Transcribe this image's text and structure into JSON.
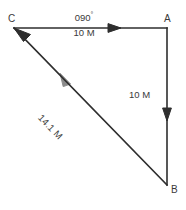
{
  "figure": {
    "type": "vector-triangle-diagram",
    "title": "",
    "background_color": "#ffffff",
    "stroke_color": "#2e2e2e",
    "text_color": "#3a3a3a"
  },
  "vertices": [
    {
      "id": "C",
      "label": "C",
      "x": 14,
      "y": 28
    },
    {
      "id": "A",
      "label": "A",
      "x": 167,
      "y": 28
    },
    {
      "id": "B",
      "label": "B",
      "x": 167,
      "y": 185
    }
  ],
  "edges": [
    {
      "id": "CA",
      "from": "C",
      "to": "A",
      "direction": "east",
      "bearing_label": "090",
      "degree_symbol": "°",
      "distance_label": "10 M",
      "arrow": "mid-segment-right"
    },
    {
      "id": "AB",
      "from": "A",
      "to": "B",
      "direction": "south",
      "distance_label": "10 M",
      "arrow": "mid-segment-down"
    },
    {
      "id": "BC",
      "from": "B",
      "to": "C",
      "direction": "northwest",
      "distance_label": "14.1 M",
      "arrow": "head-at-C"
    }
  ],
  "labels": {
    "bearing": "090",
    "degree": "°",
    "top_distance": "10 M",
    "right_distance": "10 M",
    "diagonal_distance": "14.1 M",
    "vertex_c": "C",
    "vertex_a": "A",
    "vertex_b": "B"
  }
}
